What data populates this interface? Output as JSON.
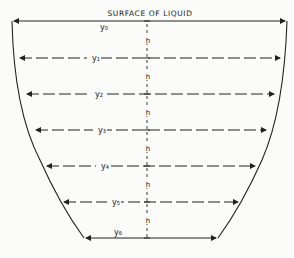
{
  "diagram": {
    "title": "SURFACE OF LIQUID",
    "interval_label": "h",
    "ordinates": [
      {
        "label": "y₀",
        "y": 21,
        "left": 12,
        "right": 287,
        "lx": 100
      },
      {
        "label": "y₁",
        "y": 58,
        "left": 18,
        "right": 282,
        "lx": 92
      },
      {
        "label": "y₂",
        "y": 94,
        "left": 25,
        "right": 276,
        "lx": 95
      },
      {
        "label": "y₃",
        "y": 130,
        "left": 34,
        "right": 268,
        "lx": 98
      },
      {
        "label": "y₄",
        "y": 166,
        "left": 45,
        "right": 257,
        "lx": 101
      },
      {
        "label": "y₅",
        "y": 202,
        "left": 62,
        "right": 240,
        "lx": 112
      },
      {
        "label": "y₆",
        "y": 238,
        "left": 84,
        "right": 218,
        "lx": 114
      }
    ],
    "colors": {
      "ink": "#222222",
      "paper": "#fbfbf9"
    }
  }
}
